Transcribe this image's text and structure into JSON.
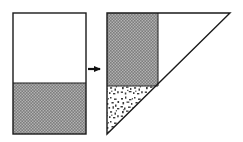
{
  "figure": {
    "title": "Rectangle to right-triangle area transformation",
    "caption": "",
    "background_color": "#ffffff",
    "stroke_color": "#1a1a1a",
    "fill_dark_color": "#2a2a2a",
    "fill_speckle_color": "#3a3a3a",
    "fill_empty_color": "#ffffff"
  },
  "shapes": {
    "left": {
      "name": "rectangle",
      "label": "",
      "x": 13,
      "y": 13,
      "width": 73,
      "height": 121,
      "fill_boundary_y": 83,
      "regions": [
        {
          "name": "upper-empty-region",
          "fill": "empty",
          "fill_label": "white",
          "fraction": 0.58
        },
        {
          "name": "lower-shaded-region",
          "fill": "checker",
          "fill_label": "dark checkerboard",
          "fraction": 0.42
        }
      ]
    },
    "right": {
      "name": "right-triangle",
      "label": "",
      "apex_top_left": [
        107,
        13
      ],
      "apex_top_right": [
        230,
        13
      ],
      "apex_bottom_left": [
        107,
        134
      ],
      "width": 123,
      "height": 121,
      "regions": [
        {
          "name": "upper-left-shaded-rect",
          "fill": "checker",
          "fill_label": "dark checkerboard",
          "x": 107,
          "y": 13,
          "width": 51,
          "height": 73
        },
        {
          "name": "lower-left-speckled-triangle",
          "fill": "speckle",
          "fill_label": "stippled speckle",
          "points": "107,86 158,86 107,134"
        },
        {
          "name": "right-empty-region",
          "fill": "empty",
          "fill_label": "white",
          "points": "158,13 230,13 158,86"
        }
      ]
    }
  },
  "arrow": {
    "name": "transformation-arrow",
    "direction": "right",
    "label": "",
    "x1": 88,
    "x2": 104,
    "y": 69
  }
}
